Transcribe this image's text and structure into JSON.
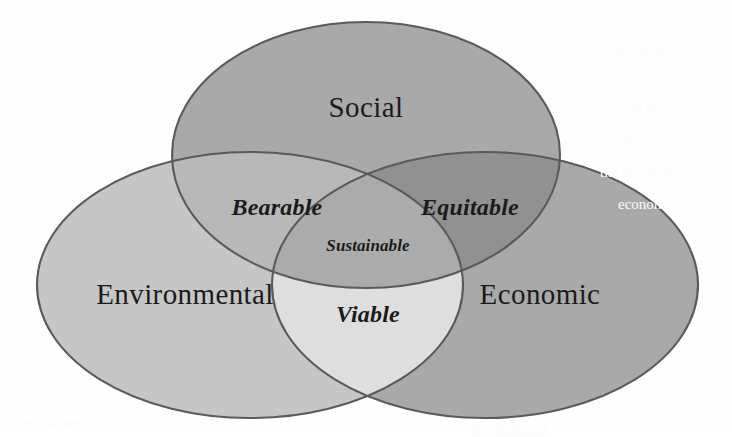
{
  "diagram": {
    "background_color": "#fefefe",
    "stroke_color": "#5a5a5a",
    "text_color": "#1b1b1b",
    "sets": [
      {
        "key": "social",
        "label": "Social",
        "fill": "#a9a9a9",
        "cx": 366,
        "cy": 155,
        "rx": 194,
        "ry": 133,
        "label_x": 366,
        "label_y": 110
      },
      {
        "key": "environmental",
        "label": "Environmental",
        "fill": "#c6c6c6",
        "cx": 250,
        "cy": 285,
        "rx": 213,
        "ry": 133,
        "label_x": 185,
        "label_y": 297
      },
      {
        "key": "economic",
        "label": "Economic",
        "fill": "#a9a9a9",
        "cx": 485,
        "cy": 285,
        "rx": 213,
        "ry": 133,
        "label_x": 540,
        "label_y": 297
      }
    ],
    "intersections": [
      {
        "key": "bearable",
        "label": "Bearable",
        "members": "Social + Environmental",
        "fill": "#b8b8b8",
        "label_x": 277,
        "label_y": 209
      },
      {
        "key": "equitable",
        "label": "Equitable",
        "members": "Social + Economic",
        "fill": "#919191",
        "label_x": 470,
        "label_y": 209
      },
      {
        "key": "viable",
        "label": "Viable",
        "members": "Environmental + Economic",
        "fill": "#dedede",
        "label_x": 368,
        "label_y": 316
      },
      {
        "key": "sustainable",
        "label": "Sustainable",
        "members": "Social + Environmental + Economic",
        "fill": "#ababab",
        "label_x": 368,
        "label_y": 247
      }
    ],
    "paper_bleed": [
      {
        "text": "the limits",
        "x": 612,
        "y": 44
      },
      {
        "text": "and for",
        "x": 624,
        "y": 72
      },
      {
        "text": "in the",
        "x": 630,
        "y": 100
      },
      {
        "text": "concept of",
        "x": 608,
        "y": 132
      },
      {
        "text": "the needs of",
        "x": 600,
        "y": 164
      },
      {
        "text": "economic",
        "x": 618,
        "y": 196
      },
      {
        "text": "social and",
        "x": 24,
        "y": 414
      },
      {
        "text": "development",
        "x": 470,
        "y": 420
      }
    ]
  }
}
